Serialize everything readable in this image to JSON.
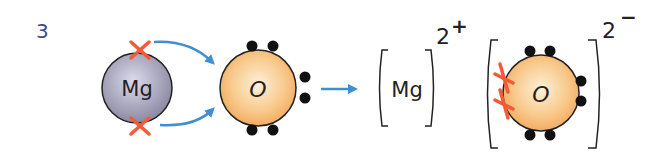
{
  "question_number": "3",
  "colors": {
    "number": "#3b4a8c",
    "mg_fill_light": "#cfcde0",
    "mg_fill_dark": "#86839e",
    "o_fill_light": "#fde6c4",
    "o_fill_dark": "#f2a75a",
    "outline": "#222222",
    "electron_dot": "#111111",
    "cross": "#f25a38",
    "arrow": "#3f8fd2",
    "bracket": "#222222"
  },
  "atoms": {
    "magnesium": {
      "symbol": "Mg",
      "outer_electrons": 2,
      "electron_marker": "cross"
    },
    "oxygen": {
      "symbol": "O",
      "outer_electrons": 6,
      "electron_marker": "dot"
    }
  },
  "ions": {
    "magnesium_ion": {
      "symbol": "Mg",
      "charge": "2",
      "charge_sign": "+"
    },
    "oxide_ion": {
      "symbol": "O",
      "charge": "2",
      "charge_sign": "−",
      "electrons_gained": 2,
      "outer_electrons": 8
    }
  }
}
